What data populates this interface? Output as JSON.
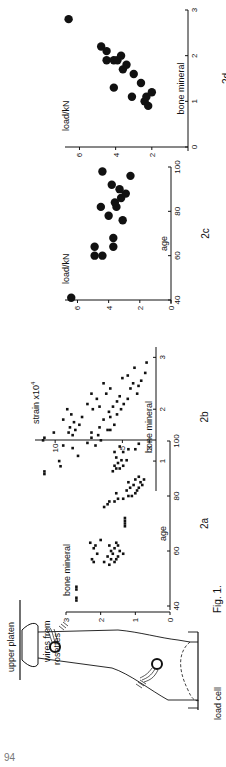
{
  "page": {
    "number": "94"
  },
  "figure1": {
    "caption": "Fig. 1.",
    "labels": {
      "upper_platen": "upper platen",
      "wires_line1": "wires  from",
      "wires_line2": "rosettes",
      "load_cell": "load  cell"
    }
  },
  "chart_data": [
    {
      "id": "2a",
      "type": "scatter",
      "panel_label": "2a",
      "xlabel": "age",
      "ylabel": "bone mineral",
      "xlim": [
        40,
        100
      ],
      "ylim": [
        0,
        3
      ],
      "xticks": [
        40,
        60,
        80,
        100
      ],
      "yticks": [
        0,
        1,
        2,
        3
      ],
      "marker": "small square",
      "points": [
        [
          42,
          2.7
        ],
        [
          43,
          2.7
        ],
        [
          46,
          2.7
        ],
        [
          47,
          2.7
        ],
        [
          55,
          1.75
        ],
        [
          56,
          1.6
        ],
        [
          57,
          1.7
        ],
        [
          57,
          1.55
        ],
        [
          58,
          1.8
        ],
        [
          56,
          1.9
        ],
        [
          58,
          1.5
        ],
        [
          59,
          1.65
        ],
        [
          60,
          1.7
        ],
        [
          60,
          1.45
        ],
        [
          61,
          1.6
        ],
        [
          59,
          1.35
        ],
        [
          62,
          1.5
        ],
        [
          62,
          1.75
        ],
        [
          63,
          1.55
        ],
        [
          56,
          2.2
        ],
        [
          57,
          2.25
        ],
        [
          59,
          2.1
        ],
        [
          61,
          2.2
        ],
        [
          62,
          2.15
        ],
        [
          63,
          2.3
        ],
        [
          64,
          2.0
        ],
        [
          69,
          1.3
        ],
        [
          70,
          1.3
        ],
        [
          71,
          1.3
        ],
        [
          72,
          1.3
        ],
        [
          76,
          1.9
        ],
        [
          77,
          1.8
        ],
        [
          78,
          1.75
        ],
        [
          78,
          1.6
        ],
        [
          79,
          1.5
        ],
        [
          79,
          1.35
        ],
        [
          80,
          1.2
        ],
        [
          80,
          1.1
        ],
        [
          81,
          1.55
        ],
        [
          81,
          1.0
        ],
        [
          82,
          0.95
        ],
        [
          82,
          1.25
        ],
        [
          83,
          0.9
        ],
        [
          83,
          1.15
        ],
        [
          84,
          0.8
        ],
        [
          84,
          1.05
        ],
        [
          85,
          0.85
        ],
        [
          85,
          1.2
        ],
        [
          86,
          1.0
        ],
        [
          86,
          0.75
        ],
        [
          87,
          0.9
        ],
        [
          89,
          1.65
        ],
        [
          90,
          1.55
        ],
        [
          90,
          1.45
        ],
        [
          91,
          1.35
        ],
        [
          91,
          1.6
        ],
        [
          92,
          1.5
        ],
        [
          93,
          1.4
        ],
        [
          93,
          1.25
        ],
        [
          94,
          1.55
        ],
        [
          96,
          1.6
        ],
        [
          96,
          1.35
        ],
        [
          97,
          1.2
        ],
        [
          97,
          1.0
        ],
        [
          98,
          1.45
        ],
        [
          99,
          0.9
        ]
      ]
    },
    {
      "id": "2b",
      "type": "scatter",
      "panel_label": "2b",
      "xlabel": "bone mineral",
      "ylabel": "strain x10^4",
      "ylabel_display": "strain x10",
      "ylabel_exp": "4",
      "xlim": [
        0.5,
        3.2
      ],
      "ylim": [
        2.5,
        11.5
      ],
      "xticks": [
        1,
        2,
        3
      ],
      "yticks": [
        3,
        5,
        10
      ],
      "marker": "small square",
      "points": [
        [
          0.75,
          10.8
        ],
        [
          0.8,
          10.8
        ],
        [
          0.9,
          9.6
        ],
        [
          1.0,
          9.7
        ],
        [
          1.1,
          8.3
        ],
        [
          1.25,
          8.7
        ],
        [
          1.3,
          9.4
        ],
        [
          1.4,
          10.9
        ],
        [
          1.45,
          10.8
        ],
        [
          1.55,
          10.1
        ],
        [
          1.3,
          7.0
        ],
        [
          1.35,
          7.6
        ],
        [
          1.4,
          6.6
        ],
        [
          1.45,
          7.3
        ],
        [
          1.5,
          6.8
        ],
        [
          1.55,
          7.3
        ],
        [
          1.6,
          6.1
        ],
        [
          1.6,
          5.9
        ],
        [
          1.65,
          6.7
        ],
        [
          1.7,
          5.6
        ],
        [
          1.5,
          8.7
        ],
        [
          1.55,
          9.0
        ],
        [
          1.6,
          8.5
        ],
        [
          1.65,
          8.9
        ],
        [
          1.7,
          8.2
        ],
        [
          1.75,
          8.6
        ],
        [
          1.8,
          9.4
        ],
        [
          1.85,
          8.0
        ],
        [
          1.9,
          8.8
        ],
        [
          2.0,
          9.1
        ],
        [
          1.8,
          6.4
        ],
        [
          1.85,
          5.9
        ],
        [
          1.9,
          5.4
        ],
        [
          1.95,
          6.0
        ],
        [
          2.0,
          5.1
        ],
        [
          2.05,
          5.7
        ],
        [
          2.1,
          4.9
        ],
        [
          2.15,
          5.4
        ],
        [
          2.2,
          4.6
        ],
        [
          2.25,
          5.2
        ],
        [
          2.0,
          7.2
        ],
        [
          2.05,
          6.7
        ],
        [
          2.1,
          7.6
        ],
        [
          2.2,
          6.9
        ],
        [
          2.3,
          7.3
        ],
        [
          2.3,
          6.2
        ],
        [
          2.4,
          5.9
        ],
        [
          2.5,
          6.4
        ],
        [
          2.5,
          4.2
        ],
        [
          2.6,
          5.0
        ],
        [
          2.45,
          3.8
        ],
        [
          2.55,
          3.6
        ],
        [
          2.65,
          4.6
        ],
        [
          2.7,
          3.3
        ],
        [
          2.8,
          4.1
        ],
        [
          2.9,
          3.2
        ],
        [
          2.4,
          4.4
        ],
        [
          2.3,
          3.9
        ]
      ]
    },
    {
      "id": "2c",
      "type": "scatter",
      "panel_label": "2c",
      "xlabel": "age",
      "ylabel": "load/kN",
      "xlim": [
        40,
        100
      ],
      "ylim": [
        0,
        6.8
      ],
      "xticks": [
        40,
        60,
        80,
        100
      ],
      "yticks": [
        0,
        2,
        4,
        6
      ],
      "marker": "large circle",
      "points": [
        [
          41,
          6.4
        ],
        [
          60,
          4.9
        ],
        [
          60,
          4.4
        ],
        [
          64,
          4.9
        ],
        [
          64,
          3.7
        ],
        [
          68,
          3.7
        ],
        [
          76,
          3.1
        ],
        [
          78,
          4.0
        ],
        [
          82,
          3.5
        ],
        [
          82,
          4.5
        ],
        [
          84,
          3.6
        ],
        [
          86,
          3.2
        ],
        [
          88,
          2.9
        ],
        [
          90,
          3.3
        ],
        [
          92,
          3.8
        ],
        [
          96,
          2.6
        ],
        [
          98,
          4.4
        ]
      ]
    },
    {
      "id": "2d",
      "type": "scatter",
      "panel_label": "2d",
      "xlabel": "bone mineral",
      "ylabel": "load/kN",
      "xlim": [
        0,
        3
      ],
      "ylim": [
        0,
        6.8
      ],
      "xticks": [
        0,
        1,
        2,
        3
      ],
      "yticks": [
        2,
        4,
        6
      ],
      "marker": "large circle",
      "points": [
        [
          2.8,
          6.6
        ],
        [
          2.2,
          4.8
        ],
        [
          2.1,
          4.5
        ],
        [
          1.9,
          4.5
        ],
        [
          1.9,
          4.1
        ],
        [
          1.7,
          3.6
        ],
        [
          1.3,
          4.1
        ],
        [
          1.9,
          3.9
        ],
        [
          2.0,
          3.7
        ],
        [
          1.8,
          3.4
        ],
        [
          1.6,
          3.0
        ],
        [
          1.1,
          3.1
        ],
        [
          1.4,
          2.6
        ],
        [
          1.0,
          2.4
        ],
        [
          1.1,
          2.3
        ],
        [
          1.2,
          2.0
        ],
        [
          0.9,
          2.2
        ]
      ]
    }
  ]
}
